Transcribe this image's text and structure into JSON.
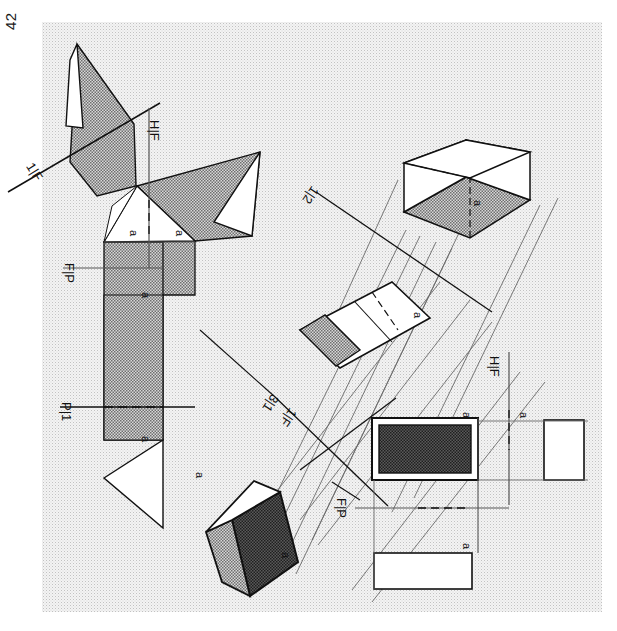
{
  "page": {
    "folio": "42",
    "orientation_note": "plate rotated 90 degrees",
    "paper_color": "#f3f3f3",
    "ink_color": "#111111"
  },
  "figures": {
    "left": {
      "name": "auxiliary-view-unfolded-prism",
      "reference_lines": [
        {
          "id": "hf",
          "label": "H|F"
        },
        {
          "id": "fp",
          "label": "F|P"
        },
        {
          "id": "p1",
          "label": "P|1"
        },
        {
          "id": "1f",
          "label": "1|F"
        }
      ],
      "point_labels": [
        {
          "id": "a1",
          "label": "a"
        },
        {
          "id": "a2",
          "label": "a"
        },
        {
          "id": "a3",
          "label": "a"
        },
        {
          "id": "a4",
          "label": "a"
        }
      ]
    },
    "right": {
      "name": "pictorial-projection-of-prism",
      "reference_lines": [
        {
          "id": "12",
          "label": "1|2"
        },
        {
          "id": "31",
          "label": "3|1"
        },
        {
          "id": "hf",
          "label": "H|F"
        },
        {
          "id": "fp",
          "label": "F|P"
        },
        {
          "id": "1f",
          "label": "1|F"
        }
      ],
      "point_labels": [
        {
          "id": "a1",
          "label": "a"
        },
        {
          "id": "a2",
          "label": "a"
        },
        {
          "id": "a3",
          "label": "a"
        },
        {
          "id": "a4",
          "label": "a"
        },
        {
          "id": "a5",
          "label": "a"
        },
        {
          "id": "a6",
          "label": "a"
        },
        {
          "id": "a7",
          "label": "a"
        }
      ]
    }
  },
  "colors": {
    "line": "#111111",
    "thin_line": "#555555",
    "fill_white": "#ffffff",
    "fill_light_hatch": "#b9b9b9",
    "fill_dark_hatch": "#4a4a4a",
    "paper": "#f3f3f3"
  }
}
